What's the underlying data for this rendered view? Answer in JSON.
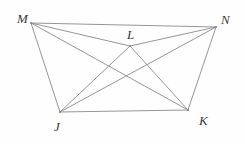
{
  "figure": {
    "type": "geometry-diagram",
    "canvas": {
      "width": 245,
      "height": 144,
      "background": "#fefefe"
    },
    "style": {
      "stroke_color": "#8a8a8a",
      "stroke_width": 0.9,
      "label_color": "#3a3a3a",
      "label_font_size": 13
    },
    "points": [
      {
        "id": "M",
        "label": "M",
        "x": 31,
        "y": 23,
        "label_x": 17,
        "label_y": 12
      },
      {
        "id": "N",
        "label": "N",
        "x": 216,
        "y": 27,
        "label_x": 221,
        "label_y": 13
      },
      {
        "id": "L",
        "label": "L",
        "x": 130,
        "y": 46,
        "label_x": 127,
        "label_y": 28
      },
      {
        "id": "J",
        "label": "J",
        "x": 60,
        "y": 112,
        "label_x": 54,
        "label_y": 120
      },
      {
        "id": "K",
        "label": "K",
        "x": 188,
        "y": 110,
        "label_x": 199,
        "label_y": 114
      }
    ],
    "segments": [
      {
        "id": "MN",
        "from": "M",
        "to": "N"
      },
      {
        "id": "MJ",
        "from": "M",
        "to": "J"
      },
      {
        "id": "ML",
        "from": "M",
        "to": "L"
      },
      {
        "id": "MK",
        "from": "M",
        "to": "K"
      },
      {
        "id": "NL",
        "from": "N",
        "to": "L"
      },
      {
        "id": "NJ",
        "from": "N",
        "to": "J"
      },
      {
        "id": "NK",
        "from": "N",
        "to": "K"
      },
      {
        "id": "JL",
        "from": "J",
        "to": "L"
      },
      {
        "id": "JK",
        "from": "J",
        "to": "K"
      },
      {
        "id": "LK",
        "from": "L",
        "to": "K"
      }
    ]
  }
}
